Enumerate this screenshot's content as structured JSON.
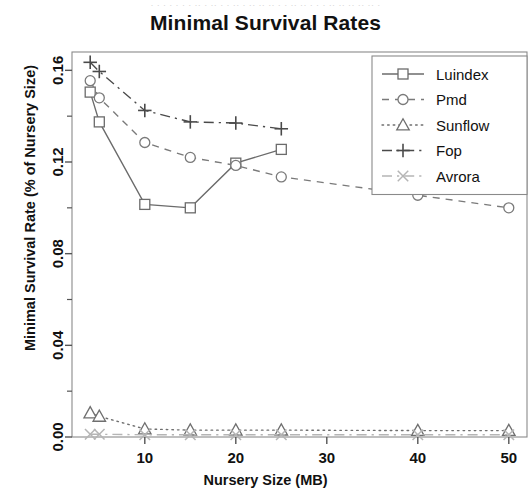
{
  "page": {
    "ghost_header": "· · ·   · · · ·   ·· · ·· ·  · ·· · ··  ·· ·· ·   · ·· ·· ·  · · ·· ·· ·· ·· ·· ·",
    "title": "Minimal Survival Rates"
  },
  "chart_data": {
    "type": "line",
    "title": "Minimal Survival Rates",
    "xlabel": "Nursery Size (MB)",
    "ylabel": "Minimal Survival Rate (% of Nursery Size)",
    "xlim": [
      2,
      52
    ],
    "ylim": [
      0.0,
      0.168
    ],
    "xticks": [
      10,
      20,
      30,
      40,
      50
    ],
    "xtick_labels": [
      "10",
      "20",
      "30",
      "40",
      "50"
    ],
    "yticks": [
      0.0,
      0.04,
      0.08,
      0.12,
      0.16
    ],
    "ytick_labels": [
      "0.00",
      "0.04",
      "0.08",
      "0.12",
      "0.16"
    ],
    "yminor_ticks": [
      0.02,
      0.06,
      0.1,
      0.14
    ],
    "grid": false,
    "legend_position": "top-right",
    "series": [
      {
        "name": "Luindex",
        "marker": "square",
        "linestyle": "solid",
        "color": "#6b6b6b",
        "x": [
          4,
          5,
          10,
          15,
          20,
          25
        ],
        "y": [
          0.1505,
          0.1375,
          0.1015,
          0.1,
          0.1195,
          0.1255
        ]
      },
      {
        "name": "Pmd",
        "marker": "circle",
        "linestyle": "dashed",
        "color": "#7a7a7a",
        "x": [
          4,
          5,
          10,
          15,
          20,
          25,
          40,
          50
        ],
        "y": [
          0.1555,
          0.148,
          0.1285,
          0.122,
          0.1185,
          0.1135,
          0.1055,
          0.1
        ]
      },
      {
        "name": "Sunflow",
        "marker": "triangle",
        "linestyle": "dotted",
        "color": "#6f6f6f",
        "x": [
          4,
          5,
          10,
          15,
          20,
          25,
          40,
          50
        ],
        "y": [
          0.0105,
          0.009,
          0.0035,
          0.003,
          0.003,
          0.003,
          0.0028,
          0.0028
        ]
      },
      {
        "name": "Fop",
        "marker": "plus",
        "linestyle": "dashdot",
        "color": "#4a4a4a",
        "x": [
          4,
          5,
          10,
          15,
          20,
          25
        ],
        "y": [
          0.1635,
          0.1595,
          0.1425,
          0.1375,
          0.137,
          0.1345
        ]
      },
      {
        "name": "Avrora",
        "marker": "cross",
        "linestyle": "dashdot",
        "color": "#b5b5b5",
        "x": [
          4,
          5,
          10,
          15,
          20,
          25,
          40,
          50
        ],
        "y": [
          0.0012,
          0.0012,
          0.001,
          0.001,
          0.001,
          0.001,
          0.001,
          0.001
        ]
      }
    ]
  }
}
